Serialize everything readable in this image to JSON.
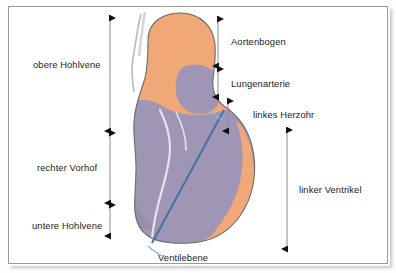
{
  "figure": {
    "kind": "anatomical-diagram",
    "border_color": "#9a9a9a",
    "background_color": "#ffffff"
  },
  "palette": {
    "aorta_orange": "#F0A878",
    "chamber_purple": "#9E96B4",
    "chamber_purple_dark": "#8E86A8",
    "outline_gray": "#6b6b6b",
    "inner_line": "#E8E4EE",
    "valve_plane_blue": "#4A6FA5",
    "leader_blue": "#7FB8D8",
    "measure_line": "#8c8c8c",
    "arrow_black": "#111111",
    "text": "#1b1b1b"
  },
  "labels": {
    "obere_hohlvene": "obere Hohlvene",
    "rechter_vorhof": "rechter Vorhof",
    "untere_hohlvene": "untere Hohlvene",
    "aortenbogen": "Aortenbogen",
    "lungenarterie": "Lungenarterie",
    "linkes_herzohr": "linkes Herzohr",
    "linker_ventrikel": "linker Ventrikel",
    "ventilebene": "Ventilebene"
  },
  "measures": [
    {
      "id": "obere-hohlvene",
      "label": "obere Hohlvene",
      "side": "left",
      "x": 110,
      "y_top": 18,
      "y_bottom": 131
    },
    {
      "id": "rechter-vorhof",
      "label": "rechter Vorhof",
      "side": "left",
      "x": 110,
      "y_top": 133,
      "y_bottom": 203
    },
    {
      "id": "untere-hohlvene",
      "label": "untere Hohlvene",
      "side": "left",
      "x": 110,
      "y_top": 205,
      "y_bottom": 236
    },
    {
      "id": "aortenbogen",
      "label": "Aortenbogen",
      "side": "right",
      "x": 218,
      "y_top": 19,
      "y_bottom": 66
    },
    {
      "id": "lungenarterie",
      "label": "Lungenarterie",
      "side": "right",
      "x": 218,
      "y_top": 69,
      "y_bottom": 97
    },
    {
      "id": "linkes-herzohr",
      "label": "linkes Herzohr",
      "side": "right",
      "x": 228,
      "y_top": 101,
      "y_bottom": 131
    },
    {
      "id": "linker-ventrikel",
      "label": "linker Ventrikel",
      "side": "right",
      "x": 287,
      "y_top": 130,
      "y_bottom": 249
    }
  ],
  "valve_plane": {
    "label": "Ventilebene",
    "line_start": [
      224,
      110
    ],
    "line_end": [
      152,
      243
    ],
    "leader_start": [
      148,
      246
    ],
    "leader_end": [
      160,
      256
    ]
  }
}
